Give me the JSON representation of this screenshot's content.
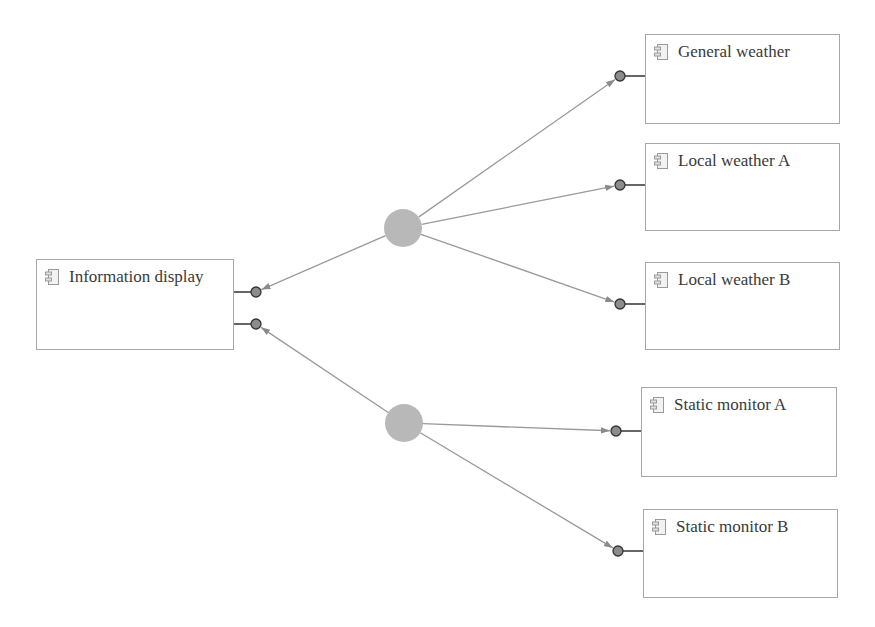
{
  "diagram": {
    "type": "component-connection-diagram",
    "colors": {
      "box_border": "#a8a8a8",
      "text": "#3a3a3a",
      "hub_fill": "#b8b8b8",
      "port_fill": "#8c8c8c",
      "port_stroke": "#333333",
      "connector_line": "#999999",
      "port_stub": "#333333"
    },
    "components": [
      {
        "id": "info",
        "label": "Information display",
        "x": 36,
        "y": 259,
        "w": 198,
        "h": 91
      },
      {
        "id": "gw",
        "label": "General weather",
        "x": 645,
        "y": 34,
        "w": 195,
        "h": 90
      },
      {
        "id": "lwa",
        "label": "Local weather A",
        "x": 645,
        "y": 143,
        "w": 195,
        "h": 88
      },
      {
        "id": "lwb",
        "label": "Local weather B",
        "x": 645,
        "y": 262,
        "w": 195,
        "h": 88
      },
      {
        "id": "sma",
        "label": "Static monitor A",
        "x": 641,
        "y": 387,
        "w": 196,
        "h": 90
      },
      {
        "id": "smb",
        "label": "Static monitor B",
        "x": 643,
        "y": 509,
        "w": 195,
        "h": 89
      }
    ],
    "hubs": [
      {
        "id": "hub-weather",
        "cx": 403,
        "cy": 228,
        "r": 19
      },
      {
        "id": "hub-monitor",
        "cx": 404,
        "cy": 423,
        "r": 19
      }
    ],
    "ports": [
      {
        "id": "p-info-1",
        "cx": 256,
        "cy": 292,
        "stub_from": 234
      },
      {
        "id": "p-info-2",
        "cx": 256,
        "cy": 324,
        "stub_from": 234
      },
      {
        "id": "p-gw",
        "cx": 620,
        "cy": 76,
        "stub_to": 645
      },
      {
        "id": "p-lwa",
        "cx": 620,
        "cy": 185,
        "stub_to": 645
      },
      {
        "id": "p-lwb",
        "cx": 620,
        "cy": 304,
        "stub_to": 645
      },
      {
        "id": "p-sma",
        "cx": 616,
        "cy": 431,
        "stub_to": 641
      },
      {
        "id": "p-smb",
        "cx": 618,
        "cy": 551,
        "stub_to": 643
      }
    ],
    "connections": [
      {
        "from": "hub-weather",
        "to": "p-info-1"
      },
      {
        "from": "hub-weather",
        "to": "p-gw"
      },
      {
        "from": "hub-weather",
        "to": "p-lwa"
      },
      {
        "from": "hub-weather",
        "to": "p-lwb"
      },
      {
        "from": "hub-monitor",
        "to": "p-info-2"
      },
      {
        "from": "hub-monitor",
        "to": "p-sma"
      },
      {
        "from": "hub-monitor",
        "to": "p-smb"
      }
    ]
  }
}
